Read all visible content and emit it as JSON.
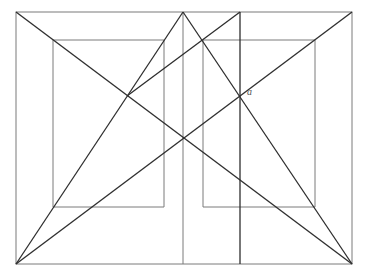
{
  "diagram": {
    "type": "geometric perspective construction",
    "outer_rect": {
      "x1": 16,
      "y1": 12,
      "x2": 352,
      "y2": 264
    },
    "inner_left_rect": {
      "x1": 53,
      "y1": 40,
      "x2": 164,
      "y2": 207
    },
    "inner_right_rect": {
      "x1": 203,
      "y1": 40,
      "x2": 315,
      "y2": 207
    },
    "apex_points": [
      {
        "x": 183,
        "y": 12
      },
      {
        "x": 240,
        "y": 12
      }
    ],
    "labels": [
      {
        "text": "a",
        "x": 247,
        "y": 88
      }
    ],
    "colors": {
      "thin_line": "#7a7a7a",
      "bold_line": "#2e2e2e",
      "label": "#555555",
      "background": "#ffffff"
    }
  }
}
